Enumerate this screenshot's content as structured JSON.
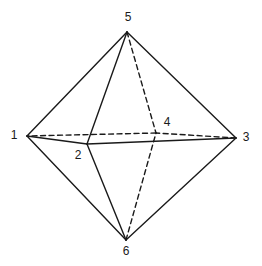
{
  "diagram": {
    "vertices": [
      {
        "id": "1",
        "label": "1",
        "x": 27,
        "y": 136,
        "lx": 14,
        "ly": 136
      },
      {
        "id": "2",
        "label": "2",
        "x": 87,
        "y": 144,
        "lx": 78,
        "ly": 156
      },
      {
        "id": "3",
        "label": "3",
        "x": 236,
        "y": 138,
        "lx": 246,
        "ly": 138
      },
      {
        "id": "4",
        "label": "4",
        "x": 156,
        "y": 133,
        "lx": 167,
        "ly": 123
      },
      {
        "id": "5",
        "label": "5",
        "x": 127,
        "y": 32,
        "lx": 128,
        "ly": 18
      },
      {
        "id": "6",
        "label": "6",
        "x": 126,
        "y": 240,
        "lx": 126,
        "ly": 252
      }
    ],
    "edges": [
      {
        "from": "5",
        "to": "1",
        "style": "solid"
      },
      {
        "from": "5",
        "to": "2",
        "style": "solid"
      },
      {
        "from": "5",
        "to": "3",
        "style": "solid"
      },
      {
        "from": "5",
        "to": "4",
        "style": "dashed"
      },
      {
        "from": "6",
        "to": "1",
        "style": "solid"
      },
      {
        "from": "6",
        "to": "2",
        "style": "solid"
      },
      {
        "from": "6",
        "to": "3",
        "style": "solid"
      },
      {
        "from": "6",
        "to": "4",
        "style": "dashed"
      },
      {
        "from": "1",
        "to": "2",
        "style": "solid"
      },
      {
        "from": "2",
        "to": "3",
        "style": "solid"
      },
      {
        "from": "3",
        "to": "4",
        "style": "dashed"
      },
      {
        "from": "4",
        "to": "1",
        "style": "dashed"
      }
    ],
    "line_color": "#1a1a1a"
  }
}
